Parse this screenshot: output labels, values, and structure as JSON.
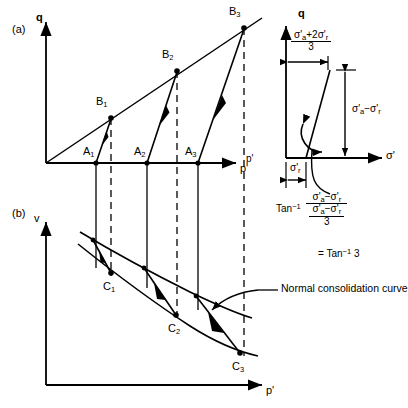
{
  "figure": {
    "panels": [
      {
        "tag": "(a)",
        "y_axis_label": "q",
        "x_axis_label": "p'",
        "points": [
          {
            "name": "A1",
            "label": "A",
            "sub": "1",
            "x": 96,
            "y": 163
          },
          {
            "name": "A2",
            "label": "A",
            "sub": "2",
            "x": 147,
            "y": 163
          },
          {
            "name": "A3",
            "label": "A",
            "sub": "3",
            "x": 198,
            "y": 163
          },
          {
            "name": "B1",
            "label": "B",
            "sub": "1",
            "x": 111,
            "y": 118
          },
          {
            "name": "B2",
            "label": "B",
            "sub": "2",
            "x": 177,
            "y": 71
          },
          {
            "name": "B3",
            "label": "B",
            "sub": "3",
            "x": 244,
            "y": 28
          }
        ]
      },
      {
        "tag": "(b)",
        "y_axis_label": "v",
        "x_axis_label": "p'",
        "points": [
          {
            "name": "C1",
            "label": "C",
            "sub": "1",
            "x": 111,
            "y": 272
          },
          {
            "name": "C2",
            "label": "C",
            "sub": "2",
            "x": 176,
            "y": 314
          },
          {
            "name": "C3",
            "label": "C",
            "sub": "3",
            "x": 240,
            "y": 352
          }
        ],
        "annotation": "Normal consolidation curve"
      }
    ],
    "inset": {
      "y_axis_label": "q",
      "x_axis_label": "σ'",
      "mean_stress": {
        "num_a": "σ'",
        "num_a_sub": "a",
        "num_rest": "+2σ'",
        "num_r_sub": "r",
        "den": "3"
      },
      "deviator": {
        "a": "σ'",
        "a_sub": "a",
        "minus": "−σ'",
        "r_sub": "r"
      },
      "radial": {
        "sym": "σ'",
        "sub": "r"
      },
      "angle_formula": {
        "prefix": "Tan",
        "exponent": "−1",
        "numerator": "σ'a−σ'r",
        "denominator_top": "σ'a−σ'r",
        "denominator_bottom": "3",
        "result_prefix": "=",
        "result": "Tan",
        "result_exponent": "−1",
        "result_value": "3"
      }
    },
    "colors": {
      "ink": "#000000",
      "background": "#ffffff"
    }
  }
}
